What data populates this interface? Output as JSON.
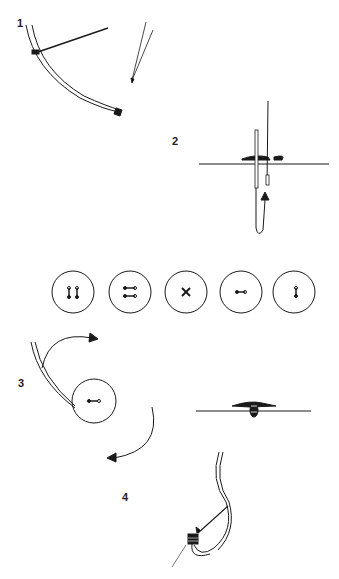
{
  "diagram": {
    "steps": [
      {
        "number": "1",
        "x": 17,
        "y": 20
      },
      {
        "number": "2",
        "x": 172,
        "y": 138
      },
      {
        "number": "3",
        "x": 18,
        "y": 380
      },
      {
        "number": "4",
        "x": 122,
        "y": 494
      }
    ],
    "buttons": [
      {
        "stitch": "two-parallel-vertical",
        "cx": 73,
        "cy": 292
      },
      {
        "stitch": "two-parallel-horizontal",
        "cx": 130,
        "cy": 292
      },
      {
        "stitch": "cross",
        "cx": 186,
        "cy": 292
      },
      {
        "stitch": "single-horizontal",
        "cx": 241,
        "cy": 292
      },
      {
        "stitch": "single-vertical",
        "cx": 294,
        "cy": 292
      }
    ],
    "colors": {
      "ink": "#1a1a1a",
      "paper": "#ffffff"
    }
  }
}
